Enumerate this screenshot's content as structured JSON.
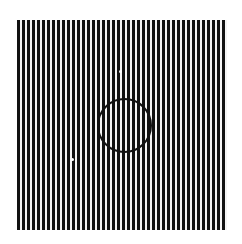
{
  "image": {
    "description": "Vertical black and white grating with a black circle outline near center",
    "stripe_color": "#111111",
    "background_color": "#f4f4f4",
    "page_background": "#ffffff",
    "stripe_period_px": 5,
    "stripe_count": 42,
    "circle": {
      "center": [
        124,
        125
      ],
      "radius": 27
    },
    "dots": [
      {
        "x": 120,
        "y": 71
      },
      {
        "x": 72,
        "y": 159
      }
    ]
  }
}
